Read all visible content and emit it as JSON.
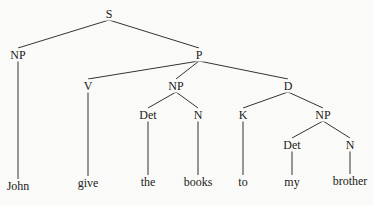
{
  "tree": {
    "nodes": [
      {
        "id": "S",
        "label": "S",
        "x": 109,
        "y": 14
      },
      {
        "id": "NP1",
        "label": "NP",
        "x": 18,
        "y": 55
      },
      {
        "id": "P",
        "label": "P",
        "x": 199,
        "y": 55
      },
      {
        "id": "V",
        "label": "V",
        "x": 88,
        "y": 86
      },
      {
        "id": "NP2",
        "label": "NP",
        "x": 176,
        "y": 86
      },
      {
        "id": "D",
        "label": "D",
        "x": 288,
        "y": 86
      },
      {
        "id": "Det1",
        "label": "Det",
        "x": 148,
        "y": 115
      },
      {
        "id": "N1",
        "label": "N",
        "x": 198,
        "y": 115
      },
      {
        "id": "K",
        "label": "K",
        "x": 243,
        "y": 115
      },
      {
        "id": "NP3",
        "label": "NP",
        "x": 323,
        "y": 115
      },
      {
        "id": "Det2",
        "label": "Det",
        "x": 292,
        "y": 145
      },
      {
        "id": "N2",
        "label": "N",
        "x": 350,
        "y": 145
      },
      {
        "id": "w1",
        "label": "John",
        "x": 18,
        "y": 186
      },
      {
        "id": "w2",
        "label": "give",
        "x": 88,
        "y": 183
      },
      {
        "id": "w3",
        "label": "the",
        "x": 148,
        "y": 182
      },
      {
        "id": "w4",
        "label": "books",
        "x": 198,
        "y": 182
      },
      {
        "id": "w5",
        "label": "to",
        "x": 243,
        "y": 182
      },
      {
        "id": "w6",
        "label": "my",
        "x": 292,
        "y": 182
      },
      {
        "id": "w7",
        "label": "brother",
        "x": 350,
        "y": 181
      }
    ],
    "edges": [
      [
        "S",
        "NP1"
      ],
      [
        "S",
        "P"
      ],
      [
        "NP1",
        "w1"
      ],
      [
        "P",
        "V"
      ],
      [
        "P",
        "NP2"
      ],
      [
        "P",
        "D"
      ],
      [
        "V",
        "w2"
      ],
      [
        "NP2",
        "Det1"
      ],
      [
        "NP2",
        "N1"
      ],
      [
        "Det1",
        "w3"
      ],
      [
        "N1",
        "w4"
      ],
      [
        "D",
        "K"
      ],
      [
        "D",
        "NP3"
      ],
      [
        "K",
        "w5"
      ],
      [
        "NP3",
        "Det2"
      ],
      [
        "NP3",
        "N2"
      ],
      [
        "Det2",
        "w6"
      ],
      [
        "N2",
        "w7"
      ]
    ]
  }
}
